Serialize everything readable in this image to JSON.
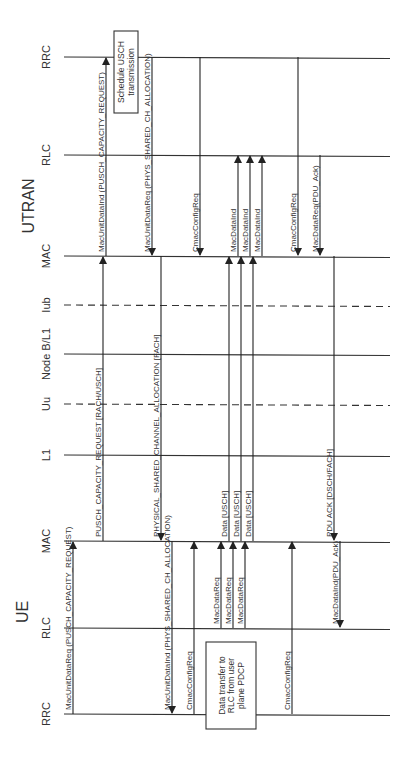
{
  "groups": {
    "utran": "UTRAN",
    "ue": "UE"
  },
  "lifelines": [
    {
      "id": "utran_rrc",
      "label": "RRC",
      "y": 57,
      "style": "solid"
    },
    {
      "id": "utran_rlc",
      "label": "RLC",
      "y": 155,
      "style": "solid"
    },
    {
      "id": "utran_mac",
      "label": "MAC",
      "y": 256,
      "style": "solid"
    },
    {
      "id": "iub",
      "label": "Iub",
      "y": 305,
      "style": "dashed"
    },
    {
      "id": "nodeb",
      "label": "Node B/L1",
      "y": 354,
      "style": "solid"
    },
    {
      "id": "uu",
      "label": "Uu",
      "y": 404,
      "style": "dashed"
    },
    {
      "id": "ue_l1",
      "label": "L1",
      "y": 455,
      "style": "solid"
    },
    {
      "id": "ue_mac",
      "label": "MAC",
      "y": 541,
      "style": "solid"
    },
    {
      "id": "ue_rlc",
      "label": "RLC",
      "y": 628,
      "style": "solid"
    },
    {
      "id": "ue_rrc",
      "label": "RRC",
      "y": 714,
      "style": "solid"
    }
  ],
  "boxes": [
    {
      "id": "schedule_usch",
      "lines": [
        "Schedule USCH",
        "transmission"
      ],
      "x": 114,
      "y": 31,
      "w": 24,
      "h": 82
    },
    {
      "id": "data_transfer",
      "lines": [
        "Data transfer to",
        "RLC from user",
        "plane PDCP"
      ],
      "x": 206,
      "y": 642,
      "w": 50,
      "h": 87
    }
  ],
  "messages": [
    {
      "label": "MacUnitDataReq (PUSCH_CAPACITY_REQUEST)",
      "x": 73,
      "from": 714,
      "to": 541
    },
    {
      "label": "PUSCH_CAPACITY_REQUEST [RACH/USCH]",
      "x": 103,
      "from": 541,
      "to": 256
    },
    {
      "label": "MacUnitDataInd (PUSCH_CAPACITY_REQUEST)",
      "x": 106,
      "from": 256,
      "to": 57
    },
    {
      "label": "MacUnitDataReq (PHYS_SHARED_CH_ALLOCATION)",
      "x": 152,
      "from": 57,
      "to": 256
    },
    {
      "label": "PHYSICAL_SHARED_CHANNEL_ALLOCATION [FACH]",
      "x": 161,
      "from": 256,
      "to": 541
    },
    {
      "label": "MacUnitDataInd (PHYS_SHARED_CH_ALLOCATION)",
      "x": 172,
      "from": 541,
      "to": 714
    },
    {
      "label": "CmacConfigReq",
      "x": 200,
      "from": 57,
      "to": 256
    },
    {
      "label": "CmacConfigReq",
      "x": 194,
      "from": 714,
      "to": 541
    },
    {
      "label": "MacDataReq",
      "x": 221,
      "from": 628,
      "to": 541
    },
    {
      "label": "MacDataReq",
      "x": 233,
      "from": 628,
      "to": 541
    },
    {
      "label": "MacDataReq",
      "x": 245,
      "from": 628,
      "to": 541
    },
    {
      "label": "Data [USCH]",
      "x": 229,
      "from": 541,
      "to": 256
    },
    {
      "label": "Data [USCH]",
      "x": 241,
      "from": 541,
      "to": 256
    },
    {
      "label": "Data [USCH]",
      "x": 253,
      "from": 541,
      "to": 256
    },
    {
      "label": "MacDataInd",
      "x": 238,
      "from": 256,
      "to": 155
    },
    {
      "label": "MacDataInd",
      "x": 250,
      "from": 256,
      "to": 155
    },
    {
      "label": "MacDataInd",
      "x": 262,
      "from": 256,
      "to": 155
    },
    {
      "label": "CmacConfigReq",
      "x": 298,
      "from": 57,
      "to": 256
    },
    {
      "label": "CmacConfigReq",
      "x": 292,
      "from": 714,
      "to": 541
    },
    {
      "label": "MacDataReq(PDU_Ack)",
      "x": 320,
      "from": 155,
      "to": 256
    },
    {
      "label": "PDU ACK [DSCH/FACH]",
      "x": 334,
      "from": 256,
      "to": 541
    },
    {
      "label": "MacDataInd(PDU_Ack)",
      "x": 340,
      "from": 541,
      "to": 628
    }
  ],
  "colors": {
    "line": "#333333",
    "text": "#333333",
    "background": "#ffffff"
  }
}
